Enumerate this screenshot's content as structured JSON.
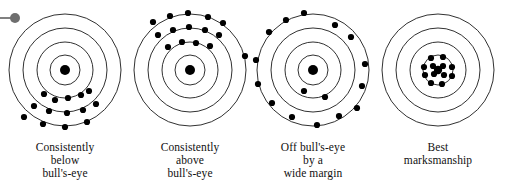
{
  "figure": {
    "background_color": "#ffffff",
    "ring_stroke_color": "#1a1a1a",
    "dot_color": "#000000",
    "marker": {
      "name": "pin-marker",
      "color": "#6e6e6e",
      "stem_color": "#808080"
    }
  },
  "chart_data": {
    "type": "scatter",
    "xlabel": "",
    "ylabel": "",
    "xlim": [
      -60,
      60
    ],
    "ylim": [
      -60,
      60
    ],
    "grid": false,
    "legend": "none",
    "panel_layout": "1 row x 4 columns",
    "ring_radii": [
      56,
      42,
      28,
      15
    ],
    "bullseye_radius": 5,
    "panels": [
      {
        "index": 0,
        "caption_lines": [
          "Consistently",
          "below",
          "bull's-eye"
        ],
        "caption_text": "Consistently below bull's-eye",
        "pattern": "biased-low",
        "shot_count": 14,
        "points": [
          [
            -21,
            -24
          ],
          [
            -10,
            -30
          ],
          [
            3,
            -28
          ],
          [
            16,
            -25
          ],
          [
            24,
            -21
          ],
          [
            -31,
            -36
          ],
          [
            -16,
            -41
          ],
          [
            2,
            -43
          ],
          [
            18,
            -40
          ],
          [
            31,
            -34
          ],
          [
            -41,
            -47
          ],
          [
            -22,
            -54
          ],
          [
            0,
            -57
          ],
          [
            22,
            -52
          ]
        ]
      },
      {
        "index": 1,
        "caption_lines": [
          "Consistently",
          "above",
          "bull's-eye"
        ],
        "caption_text": "Consistently above bull's-eye",
        "pattern": "biased-high",
        "shot_count": 15,
        "points": [
          [
            -22,
            23
          ],
          [
            -8,
            28
          ],
          [
            6,
            27
          ],
          [
            20,
            24
          ],
          [
            -32,
            35
          ],
          [
            -17,
            40
          ],
          [
            -1,
            43
          ],
          [
            15,
            40
          ],
          [
            29,
            35
          ],
          [
            -37,
            48
          ],
          [
            -20,
            54
          ],
          [
            -2,
            57
          ],
          [
            18,
            53
          ],
          [
            33,
            47
          ],
          [
            55,
            14
          ]
        ]
      },
      {
        "index": 2,
        "caption_lines": [
          "Off bull's-eye",
          "by a",
          "wide margin"
        ],
        "caption_text": "Off bull's-eye by a wide margin",
        "pattern": "scattered-wide",
        "shot_count": 16,
        "points": [
          [
            -9,
            57
          ],
          [
            -27,
            50
          ],
          [
            -44,
            38
          ],
          [
            22,
            45
          ],
          [
            38,
            33
          ],
          [
            -57,
            10
          ],
          [
            52,
            6
          ],
          [
            -55,
            -14
          ],
          [
            49,
            -16
          ],
          [
            -41,
            -33
          ],
          [
            -9,
            -21
          ],
          [
            12,
            -27
          ],
          [
            -21,
            -47
          ],
          [
            4,
            -55
          ],
          [
            26,
            -46
          ],
          [
            44,
            -38
          ]
        ]
      },
      {
        "index": 3,
        "caption_lines": [
          "Best",
          "marksmanship"
        ],
        "caption_text": "Best marksmanship",
        "pattern": "tight-center-cluster",
        "shot_count": 13,
        "points": [
          [
            -7,
            12
          ],
          [
            5,
            13
          ],
          [
            -14,
            3
          ],
          [
            -5,
            4
          ],
          [
            5,
            4
          ],
          [
            14,
            3
          ],
          [
            -13,
            -5
          ],
          [
            -4,
            -4
          ],
          [
            6,
            -5
          ],
          [
            14,
            -6
          ],
          [
            -7,
            -13
          ],
          [
            4,
            -14
          ],
          [
            0,
            0
          ]
        ]
      }
    ]
  }
}
